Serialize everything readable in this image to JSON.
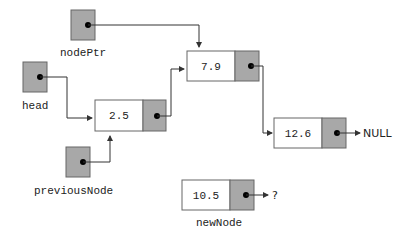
{
  "colors": {
    "pointer_fill": "#a8a8a8",
    "node_fill": "#ffffff",
    "stroke": "#555555",
    "line": "#333333"
  },
  "pointers": [
    {
      "id": "nodePtr",
      "label": "nodePtr"
    },
    {
      "id": "head",
      "label": "head"
    },
    {
      "id": "previousNode",
      "label": "previousNode"
    }
  ],
  "nodes": [
    {
      "id": "n1",
      "value": "2.5"
    },
    {
      "id": "n2",
      "value": "7.9"
    },
    {
      "id": "n3",
      "value": "12.6",
      "next": "NULL"
    },
    {
      "id": "newNode",
      "value": "10.5",
      "label": "newNode",
      "next": "?"
    }
  ]
}
